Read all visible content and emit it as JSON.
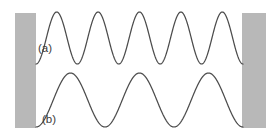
{
  "figure": {
    "background_color": "#ffffff",
    "width": 280,
    "height": 136
  },
  "walls": {
    "color": "#b8b8b8",
    "left": {
      "label": "left-wall",
      "x": 15,
      "y": 13,
      "width": 21,
      "height": 115
    },
    "right": {
      "label": "right-wall",
      "x": 242,
      "y": 13,
      "width": 24,
      "height": 115
    }
  },
  "labels": {
    "wave_a": "(a)",
    "wave_b": "(b)",
    "wave_a_x": 38,
    "wave_a_y": 49,
    "wave_b_x": 42,
    "wave_b_y": 120
  },
  "chart_data": {
    "type": "line",
    "xlabel": "",
    "ylabel": "",
    "grid": false,
    "legend": "inline labels",
    "x_domain": [
      36,
      243
    ],
    "series": [
      {
        "name": "(a)",
        "label": "(a)",
        "harmonic_wavelengths": 5,
        "peaks": 5,
        "troughs": 5,
        "amplitude_px": 26,
        "center_y_px": 38,
        "peak_y_px": 12,
        "trough_y_px": 64,
        "stroke_color": "#4c4c4c",
        "stroke_width": 1.25,
        "peak_x_px": [
          56,
          97,
          139,
          180,
          222
        ],
        "trough_x_px": [
          77,
          118,
          160,
          201
        ]
      },
      {
        "name": "(b)",
        "label": "(b)",
        "harmonic_wavelengths": 3,
        "peaks": 3,
        "troughs": 3,
        "amplitude_px": 27,
        "center_y_px": 100,
        "peak_y_px": 73,
        "trough_y_px": 128,
        "stroke_color": "#4c4c4c",
        "stroke_width": 1.25,
        "peak_x_px": [
          69,
          138,
          207
        ],
        "trough_x_px": [
          104,
          173,
          242
        ]
      }
    ]
  }
}
